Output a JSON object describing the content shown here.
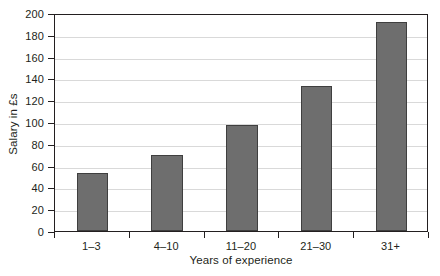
{
  "chart_data": {
    "type": "bar",
    "title": "",
    "categories": [
      "1–3",
      "4–10",
      "11–20",
      "21–30",
      "31+"
    ],
    "values": [
      53,
      70,
      97,
      133,
      192
    ],
    "xlabel": "Years of experience",
    "ylabel": "Salary in £s",
    "ylim": [
      0,
      200
    ],
    "ytick_step": 20,
    "yticks": [
      0,
      20,
      40,
      60,
      80,
      100,
      120,
      140,
      160,
      180,
      200
    ],
    "ytick_labels": [
      "0",
      "20",
      "40",
      "60",
      "80",
      "100",
      "120",
      "140",
      "160",
      "180",
      "200"
    ],
    "grid": true,
    "grid_axis": "y",
    "legend": false,
    "legend_position": "none",
    "bar_color": "#6e6e6e",
    "bar_edge_color": "#3f3f3f",
    "grid_color": "#d9d9d9",
    "axis_color": "#231f20",
    "background": "#ffffff"
  }
}
